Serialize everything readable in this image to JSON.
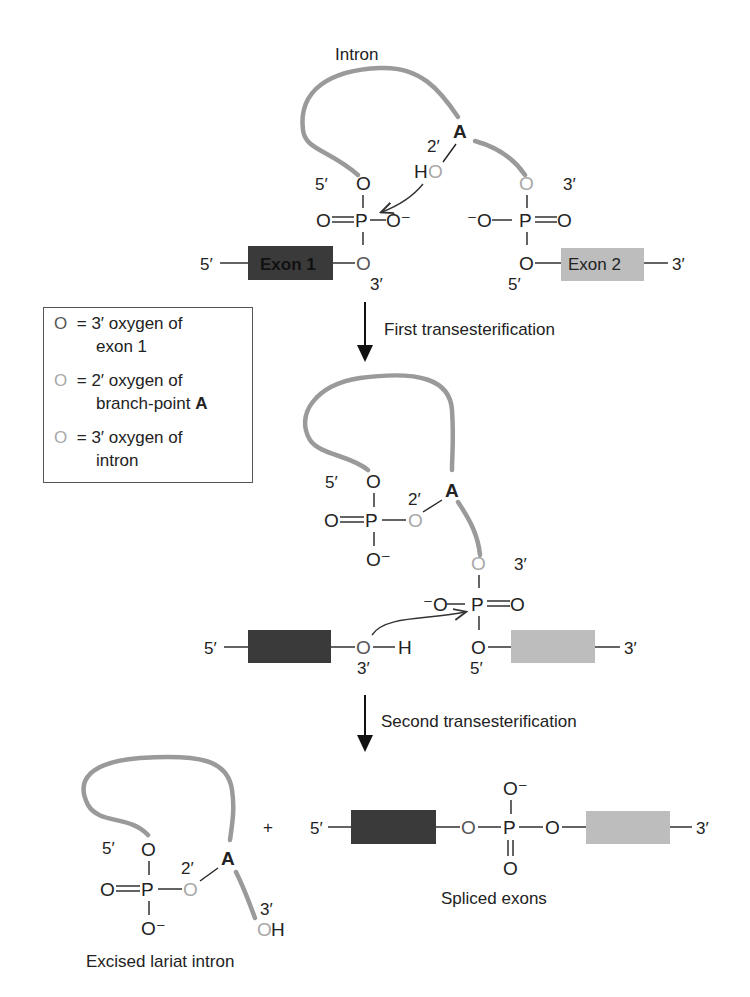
{
  "colors": {
    "exon1": "#3a3a3a",
    "exon2": "#bdbdbd",
    "intron": "#9a9a9a",
    "oxygen_exon1": "#555555",
    "oxygen_branch": "#a8a8a8",
    "oxygen_intron": "#a8a8a8"
  },
  "top": {
    "intron_label": "Intron",
    "branch_A": "A",
    "prime_2": "2′",
    "prime_5_left": "5′",
    "prime_3_right": "3′",
    "HO_H": "H",
    "O": "O",
    "P": "P",
    "O_minus": "O⁻",
    "minus_O": "⁻O",
    "exon1_label": "Exon 1",
    "exon2_label": "Exon 2",
    "end_5": "5′",
    "end_3": "3′",
    "bond_3": "3′",
    "bond_5": "5′"
  },
  "legend": {
    "items": [
      {
        "symbol": "O",
        "line1": "= 3′ oxygen of",
        "line2": "exon 1",
        "color": "#555555"
      },
      {
        "symbol": "O",
        "line1": "= 2′ oxygen of",
        "line2": "branch-point ",
        "line2_bold": "A",
        "color": "#a8a8a8"
      },
      {
        "symbol": "O",
        "line1": "= 3′ oxygen of",
        "line2": "intron",
        "color": "#a8a8a8"
      }
    ]
  },
  "steps": {
    "first": "First transesterification",
    "second": "Second transesterification"
  },
  "middle": {
    "branch_A": "A",
    "prime_2": "2′",
    "prime_5": "5′",
    "prime_3_intron": "3′",
    "H": "H",
    "end_5": "5′",
    "end_3": "3′",
    "oh_3": "3′",
    "p_5": "5′"
  },
  "bottom": {
    "plus": "+",
    "lariat_caption": "Excised lariat intron",
    "spliced_caption": "Spliced exons",
    "branch_A": "A",
    "prime_2": "2′",
    "prime_5": "5′",
    "prime_3": "3′",
    "H": "H",
    "end_5": "5′",
    "end_3": "3′"
  }
}
